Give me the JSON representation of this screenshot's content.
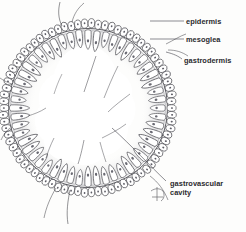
{
  "figure": {
    "background_color": "#fdfdfc",
    "ink_color": "#3a3a40",
    "label_color": "#2b2b2e",
    "signature_present": true,
    "signature_name": "artist-monogram"
  },
  "labels": [
    {
      "id": "epidermis",
      "text": "epidermis",
      "x": 186,
      "y": 24,
      "leader": "straight"
    },
    {
      "id": "mesoglea",
      "text": "mesoglea",
      "x": 186,
      "y": 42,
      "leader": "straight"
    },
    {
      "id": "gastrodermis",
      "text": "gastrodermis",
      "x": 184,
      "y": 63,
      "leader": "curved"
    },
    {
      "id": "gastrovascular",
      "text": "gastrovascular",
      "x": 170,
      "y": 186,
      "leader": "curved"
    },
    {
      "id": "gastrovascular2",
      "text": "cavity",
      "x": 170,
      "y": 195,
      "leader": "none"
    }
  ],
  "structures": [
    {
      "id": "epidermis-layer",
      "name": "epidermis",
      "description": "outer ring of rounded cells"
    },
    {
      "id": "mesoglea-layer",
      "name": "mesoglea",
      "description": "thin acellular line between layers"
    },
    {
      "id": "gastrodermis-layer",
      "name": "gastrodermis",
      "description": "inner ring of columnar cells"
    },
    {
      "id": "cavity",
      "name": "gastrovascular cavity",
      "description": "central open lumen"
    }
  ],
  "chart_data": {
    "type": "diagram",
    "categories": [
      "epidermis",
      "mesoglea",
      "gastrodermis",
      "gastrovascular cavity"
    ],
    "annotations": [
      "epidermis",
      "mesoglea",
      "gastrodermis",
      "gastrovascular cavity"
    ]
  }
}
